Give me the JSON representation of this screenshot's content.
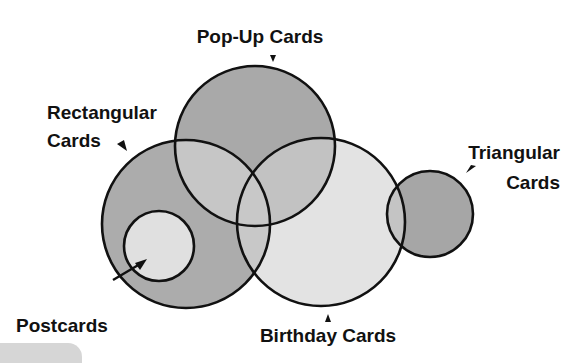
{
  "diagram": {
    "type": "venn",
    "sets": [
      {
        "id": "popup",
        "label": "Pop-Up Cards",
        "cx": 255,
        "cy": 146,
        "r": 80,
        "fill": "#a9a9a9"
      },
      {
        "id": "rectangular",
        "label_line1": "Rectangular",
        "label_line2": "Cards",
        "cx": 186,
        "cy": 224,
        "r": 84,
        "fill": "#acacac"
      },
      {
        "id": "birthday",
        "label": "Birthday Cards",
        "cx": 321,
        "cy": 222,
        "r": 84,
        "fill": "#e3e3e3"
      },
      {
        "id": "triangular",
        "label_line1": "Triangular",
        "label_line2": "Cards",
        "cx": 430,
        "cy": 214,
        "r": 43,
        "fill": "#a6a6a6"
      },
      {
        "id": "postcards",
        "label": "Postcards",
        "cx": 159,
        "cy": 246,
        "r": 35,
        "fill": "#e0e0e0"
      }
    ],
    "overlap_fill": "#c6c6c6",
    "stroke_color": "#111111",
    "relations": [
      "Postcards is a subset of Rectangular Cards",
      "Pop-Up Cards overlaps Rectangular Cards and Birthday Cards",
      "Rectangular Cards overlaps Birthday Cards",
      "Birthday Cards overlaps Triangular Cards"
    ]
  },
  "labels": {
    "popup": "Pop-Up Cards",
    "rectangular_line1": "Rectangular",
    "rectangular_line2": "Cards",
    "triangular_line1": "Triangular",
    "triangular_line2": "Cards",
    "postcards": "Postcards",
    "birthday": "Birthday Cards"
  }
}
